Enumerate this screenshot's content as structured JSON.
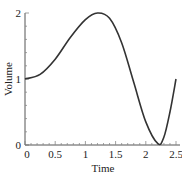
{
  "chart_data": {
    "type": "line",
    "title": "",
    "xlabel": "Time",
    "ylabel": "Volume",
    "xlim": [
      0,
      2.5
    ],
    "ylim": [
      0,
      2
    ],
    "x_ticks": [
      "0",
      "0.5",
      "1",
      "1.5",
      "2",
      "2.5"
    ],
    "y_ticks": [
      "0",
      "1",
      "2"
    ],
    "grid": false,
    "legend": null,
    "series": [
      {
        "name": "Volume",
        "x": [
          0,
          0.25,
          0.5,
          0.75,
          1.0,
          1.2,
          1.4,
          1.6,
          1.8,
          2.0,
          2.2,
          2.3,
          2.4,
          2.5
        ],
        "values": [
          1.0,
          1.07,
          1.3,
          1.63,
          1.9,
          2.0,
          1.92,
          1.55,
          0.95,
          0.35,
          0.02,
          0.12,
          0.5,
          1.0
        ]
      }
    ]
  },
  "axes": {
    "xlabel": "Time",
    "ylabel": "Volume",
    "x_tick_labels": [
      "0",
      "0.5",
      "1",
      "1.5",
      "2",
      "2.5"
    ],
    "y_tick_labels": [
      "0",
      "1",
      "2"
    ]
  }
}
